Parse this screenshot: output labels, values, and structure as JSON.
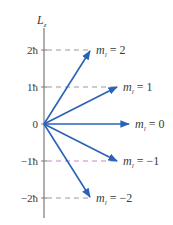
{
  "diagram": {
    "axis_label": "L",
    "axis_label_sub": "z",
    "colors": {
      "arrow": "#2a62b8",
      "axis": "#7a7a7a",
      "dash": "#9a9a9a",
      "dash_minus1": "#c08ac0",
      "text": "#3a3a3a"
    },
    "ticks": [
      {
        "label": "2ħ",
        "value": 2
      },
      {
        "label": "1ħ",
        "value": 1
      },
      {
        "label": "0",
        "value": 0
      },
      {
        "label": "−1ħ",
        "value": -1
      },
      {
        "label": "−2ħ",
        "value": -2
      }
    ],
    "vectors": [
      {
        "m": 2,
        "label_var": "m",
        "label_sub": "l",
        "label_eq": " = 2"
      },
      {
        "m": 1,
        "label_var": "m",
        "label_sub": "l",
        "label_eq": " = 1"
      },
      {
        "m": 0,
        "label_var": "m",
        "label_sub": "l",
        "label_eq": " = 0"
      },
      {
        "m": -1,
        "label_var": "m",
        "label_sub": "l",
        "label_eq": " = −1"
      },
      {
        "m": -2,
        "label_var": "m",
        "label_sub": "l",
        "label_eq": " = −2"
      }
    ]
  }
}
